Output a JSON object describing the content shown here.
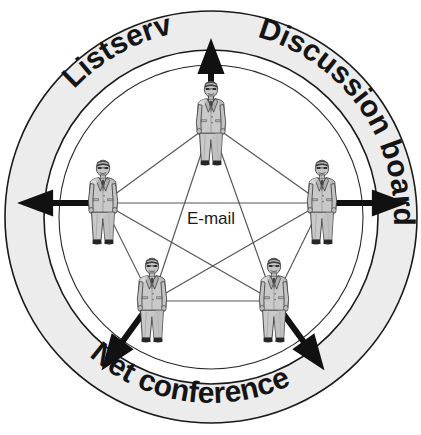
{
  "diagram": {
    "title": "Online collaboration tools network diagram",
    "center_label": "E-mail",
    "ring_labels": [
      {
        "id": "listserv",
        "text": "Listserv",
        "position": "upper-left"
      },
      {
        "id": "discussion-board",
        "text": "Discussion board",
        "position": "upper-right"
      },
      {
        "id": "net-conference",
        "text": "Net conference",
        "position": "bottom"
      }
    ],
    "nodes": [
      {
        "id": "node-top",
        "name": "businessman-figure",
        "x": 211,
        "y": 124,
        "arrow_direction": "up",
        "arrow_angle": -90
      },
      {
        "id": "node-left",
        "name": "businessman-figure",
        "x": 103,
        "y": 203,
        "arrow_direction": "left",
        "arrow_angle": 180
      },
      {
        "id": "node-right",
        "name": "businessman-figure",
        "x": 322,
        "y": 203,
        "arrow_direction": "right",
        "arrow_angle": 0
      },
      {
        "id": "node-bottom-left",
        "name": "businessman-figure",
        "x": 152,
        "y": 301,
        "arrow_direction": "down-left",
        "arrow_angle": 126
      },
      {
        "id": "node-bottom-right",
        "name": "businessman-figure",
        "x": 274,
        "y": 301,
        "arrow_direction": "down-right",
        "arrow_angle": 54
      }
    ],
    "edges": [
      [
        "node-top",
        "node-left"
      ],
      [
        "node-top",
        "node-right"
      ],
      [
        "node-top",
        "node-bottom-left"
      ],
      [
        "node-top",
        "node-bottom-right"
      ],
      [
        "node-left",
        "node-right"
      ],
      [
        "node-left",
        "node-bottom-left"
      ],
      [
        "node-left",
        "node-bottom-right"
      ],
      [
        "node-right",
        "node-bottom-left"
      ],
      [
        "node-right",
        "node-bottom-right"
      ],
      [
        "node-bottom-left",
        "node-bottom-right"
      ]
    ],
    "geometry": {
      "center_x": 211,
      "center_y": 217,
      "outer_radius": 207,
      "ring_inner_radius": 167,
      "inner_circle_radius": 152
    },
    "colors": {
      "ring_fill": "#ececec",
      "ring_stroke": "#1a1a1a",
      "inner_fill": "#ffffff",
      "edge_line": "#555555",
      "arrow_fill": "#111111",
      "text": "#1a1a1a",
      "suit_light": "#cfcfcf",
      "suit_mid": "#a8a8a8",
      "suit_dark": "#7a7a7a",
      "outline": "#3a3a3a"
    }
  }
}
